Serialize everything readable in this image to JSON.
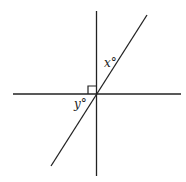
{
  "diagram": {
    "type": "geometry-angles",
    "colors": {
      "line": "#222222",
      "background": "#ffffff"
    },
    "lines": [
      {
        "name": "horizontal-line",
        "x1": 13,
        "y1": 94,
        "x2": 181,
        "y2": 94
      },
      {
        "name": "vertical-line",
        "x1": 96,
        "y1": 11,
        "x2": 97,
        "y2": 176
      },
      {
        "name": "diagonal-line",
        "x1": 51,
        "y1": 166,
        "x2": 147,
        "y2": 15
      }
    ],
    "right_angle_marker": {
      "x": 88,
      "y": 86,
      "size": 8
    },
    "labels": {
      "x": "x°",
      "y": "y°"
    }
  }
}
